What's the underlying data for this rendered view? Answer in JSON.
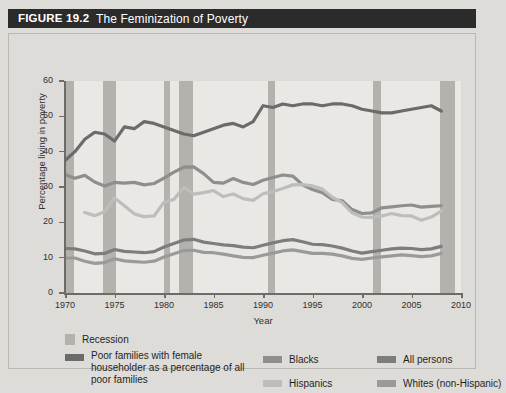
{
  "header": {
    "figure_label": "FIGURE 19.2",
    "title": "The Feminization of Poverty"
  },
  "axes": {
    "ylabel": "Percentage living in poverty",
    "xlabel": "Year",
    "y_ticks": [
      "0",
      "10",
      "20",
      "30",
      "40",
      "50",
      "60"
    ],
    "x_ticks": [
      "1970",
      "1975",
      "1980",
      "1985",
      "1990",
      "1995",
      "2000",
      "2005",
      "2010"
    ]
  },
  "legend": {
    "recession": "Recession",
    "female_householder": "Poor families with female householder as a percentage of all poor families",
    "blacks": "Blacks",
    "hispanics": "Hispanics",
    "all_persons": "All persons",
    "whites": "Whites (non-Hispanic)"
  },
  "colors": {
    "header_bar": "#2b2b2b",
    "page_background": "#dedcd8",
    "plot_background": "#e9e8e4",
    "recession_band": "#b4b2ad",
    "female_householder": "#6b6b6b",
    "blacks": "#8e8e8e",
    "hispanics": "#bdbdbd",
    "all_persons": "#7d7d7d",
    "whites": "#9a9a9a",
    "axis": "#6e6c68"
  },
  "chart_data": {
    "type": "line",
    "title": "The Feminization of Poverty",
    "xlabel": "Year",
    "ylabel": "Percentage living in poverty",
    "xlim": [
      1970,
      2010
    ],
    "ylim": [
      0,
      60
    ],
    "grid": false,
    "legend_position": "below",
    "x": [
      1970,
      1971,
      1972,
      1973,
      1974,
      1975,
      1976,
      1977,
      1978,
      1979,
      1980,
      1981,
      1982,
      1983,
      1984,
      1985,
      1986,
      1987,
      1988,
      1989,
      1990,
      1991,
      1992,
      1993,
      1994,
      1995,
      1996,
      1997,
      1998,
      1999,
      2000,
      2001,
      2002,
      2003,
      2004,
      2005,
      2006,
      2007,
      2008
    ],
    "series": [
      {
        "name": "Poor families with female householder as a percentage of all poor families",
        "color": "#6b6b6b",
        "values": [
          37.5,
          40.0,
          43.5,
          45.5,
          45.0,
          43.0,
          47.0,
          46.5,
          48.5,
          48.0,
          47.0,
          46.0,
          45.0,
          44.5,
          45.5,
          46.5,
          47.5,
          48.0,
          47.0,
          48.5,
          53.0,
          52.5,
          53.5,
          53.0,
          53.5,
          53.5,
          53.0,
          53.5,
          53.5,
          53.0,
          52.0,
          51.5,
          51.0,
          51.0,
          51.5,
          52.0,
          52.5,
          53.0,
          51.5
        ]
      },
      {
        "name": "Blacks",
        "color": "#8e8e8e",
        "values": [
          33.5,
          32.5,
          33.3,
          31.4,
          30.3,
          31.3,
          31.1,
          31.3,
          30.6,
          31.0,
          32.5,
          34.2,
          35.6,
          35.7,
          33.8,
          31.3,
          31.1,
          32.4,
          31.3,
          30.7,
          31.9,
          32.7,
          33.4,
          33.1,
          30.6,
          29.3,
          28.4,
          26.5,
          26.1,
          23.6,
          22.5,
          22.7,
          24.1,
          24.4,
          24.7,
          24.9,
          24.3,
          24.5,
          24.7
        ]
      },
      {
        "name": "Hispanics",
        "color": "#bdbdbd",
        "values": [
          null,
          null,
          22.8,
          21.9,
          23.0,
          26.9,
          24.7,
          22.4,
          21.6,
          21.8,
          25.7,
          26.5,
          29.9,
          28.0,
          28.4,
          29.0,
          27.3,
          28.0,
          26.7,
          26.2,
          28.1,
          28.7,
          29.6,
          30.6,
          30.7,
          30.3,
          29.4,
          27.1,
          25.6,
          22.7,
          21.5,
          21.4,
          21.8,
          22.5,
          21.9,
          21.8,
          20.6,
          21.5,
          23.2
        ]
      },
      {
        "name": "All persons",
        "color": "#7d7d7d",
        "values": [
          12.6,
          12.5,
          11.9,
          11.1,
          11.2,
          12.3,
          11.8,
          11.6,
          11.4,
          11.7,
          13.0,
          14.0,
          15.0,
          15.2,
          14.4,
          14.0,
          13.6,
          13.4,
          13.0,
          12.8,
          13.5,
          14.2,
          14.8,
          15.1,
          14.5,
          13.8,
          13.7,
          13.3,
          12.7,
          11.9,
          11.3,
          11.7,
          12.1,
          12.5,
          12.7,
          12.6,
          12.3,
          12.5,
          13.2
        ]
      },
      {
        "name": "Whites (non-Hispanic)",
        "color": "#9a9a9a",
        "values": [
          9.9,
          9.9,
          9.0,
          8.4,
          8.6,
          9.7,
          9.1,
          8.9,
          8.7,
          9.0,
          10.2,
          11.1,
          12.0,
          12.1,
          11.5,
          11.4,
          11.0,
          10.5,
          10.1,
          10.0,
          10.7,
          11.3,
          11.9,
          12.2,
          11.7,
          11.2,
          11.2,
          11.0,
          10.5,
          9.8,
          9.5,
          9.9,
          10.2,
          10.5,
          10.8,
          10.6,
          10.3,
          10.5,
          11.2
        ]
      }
    ],
    "recessions": [
      {
        "start": 1969.9,
        "end": 1970.9
      },
      {
        "start": 1973.8,
        "end": 1975.2
      },
      {
        "start": 1980.0,
        "end": 1980.6
      },
      {
        "start": 1981.5,
        "end": 1982.9
      },
      {
        "start": 1990.5,
        "end": 1991.2
      },
      {
        "start": 2001.1,
        "end": 2001.9
      },
      {
        "start": 2007.9,
        "end": 2009.4
      }
    ]
  }
}
